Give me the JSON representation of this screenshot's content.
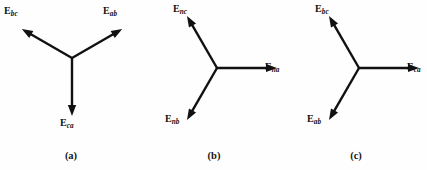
{
  "figure": {
    "type": "phasor-diagram-set",
    "background_color": "#fefefe",
    "line_color": "#111111",
    "panel_count": 3
  },
  "panels": [
    {
      "id": "a",
      "caption": "(a)",
      "vertex": {
        "x": 72,
        "y": 58
      },
      "vectors": [
        {
          "name": "E_bc",
          "label_main": "E",
          "label_sub": "bc",
          "angle_deg": 150,
          "length": 58,
          "label_x": 4,
          "label_y": 6
        },
        {
          "name": "E_ab",
          "label_main": "E",
          "label_sub": "ab",
          "angle_deg": 30,
          "length": 58,
          "label_x": 103,
          "label_y": 6
        },
        {
          "name": "E_ca",
          "label_main": "E",
          "label_sub": "ca",
          "angle_deg": 270,
          "length": 58,
          "label_x": 60,
          "label_y": 118
        }
      ]
    },
    {
      "id": "b",
      "caption": "(b)",
      "vertex": {
        "x": 74,
        "y": 68
      },
      "vectors": [
        {
          "name": "E_na",
          "label_main": "E",
          "label_sub": "na",
          "angle_deg": 0,
          "length": 60,
          "label_x": 122,
          "label_y": 62
        },
        {
          "name": "E_nc",
          "label_main": "E",
          "label_sub": "nc",
          "angle_deg": 120,
          "length": 60,
          "label_x": 30,
          "label_y": 4
        },
        {
          "name": "E_nb",
          "label_main": "E",
          "label_sub": "nb",
          "angle_deg": 240,
          "length": 60,
          "label_x": 22,
          "label_y": 114
        }
      ]
    },
    {
      "id": "c",
      "caption": "(c)",
      "vertex": {
        "x": 74,
        "y": 68
      },
      "vectors": [
        {
          "name": "E_ca",
          "label_main": "E",
          "label_sub": "ca",
          "angle_deg": 0,
          "length": 60,
          "label_x": 122,
          "label_y": 62
        },
        {
          "name": "E_bc",
          "label_main": "E",
          "label_sub": "bc",
          "angle_deg": 120,
          "length": 60,
          "label_x": 30,
          "label_y": 4
        },
        {
          "name": "E_ab",
          "label_main": "E",
          "label_sub": "ab",
          "angle_deg": 240,
          "length": 60,
          "label_x": 22,
          "label_y": 114
        }
      ]
    }
  ]
}
